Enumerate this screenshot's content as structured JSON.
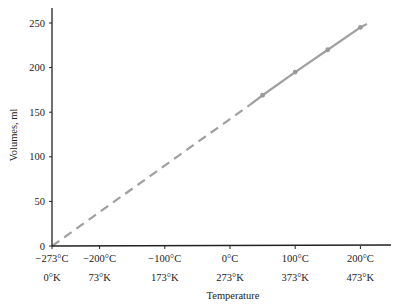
{
  "chart_data": {
    "type": "line",
    "title": "",
    "xlabel": "Temperature",
    "ylabel": "Volumes, ml",
    "x_ticks": [
      {
        "celsius": -273,
        "label_c": "−273°C",
        "label_k": "0°K"
      },
      {
        "celsius": -200,
        "label_c": "−200°C",
        "label_k": "73°K"
      },
      {
        "celsius": -100,
        "label_c": "−100°C",
        "label_k": "173°K"
      },
      {
        "celsius": 0,
        "label_c": "0°C",
        "label_k": "273°K"
      },
      {
        "celsius": 100,
        "label_c": "100°C",
        "label_k": "373°K"
      },
      {
        "celsius": 200,
        "label_c": "200°C",
        "label_k": "473°K"
      }
    ],
    "y_ticks": [
      0,
      50,
      100,
      150,
      200,
      250
    ],
    "xlim_celsius": [
      -273,
      210
    ],
    "ylim": [
      0,
      265
    ],
    "grid": false,
    "series": [
      {
        "name": "Measured volume",
        "style": "solid",
        "color": "#a0a0a0",
        "x_celsius": [
          50,
          100,
          150,
          200
        ],
        "values": [
          169,
          195,
          220,
          245
        ]
      },
      {
        "name": "Extrapolation to absolute zero",
        "style": "dashed",
        "color": "#a0a0a0",
        "x_celsius": [
          -273,
          30
        ],
        "values": [
          0,
          158
        ]
      }
    ],
    "line_end": {
      "x_celsius": 210,
      "value": 249
    }
  }
}
